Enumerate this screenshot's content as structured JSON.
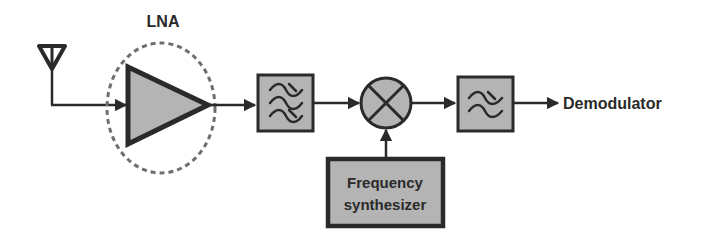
{
  "diagram": {
    "colors": {
      "stroke": "#2a2a2a",
      "block_fill": "#b4b4b4",
      "dashed": "#6e6e6e",
      "background": "#ffffff"
    },
    "blocks": {
      "antenna": {
        "label": ""
      },
      "lna": {
        "label": "LNA"
      },
      "bandpass_filter": {
        "label": ""
      },
      "mixer": {
        "label": ""
      },
      "lowpass_filter": {
        "label": ""
      },
      "synthesizer": {
        "line1": "Frequency",
        "line2": "synthesizer"
      },
      "output": {
        "label": "Demodulator"
      }
    }
  }
}
